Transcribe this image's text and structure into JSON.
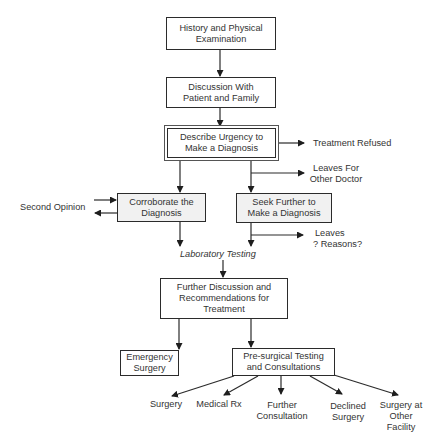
{
  "diagram": {
    "type": "flowchart",
    "nodes": {
      "history": {
        "line1": "History and Physical",
        "line2": "Examination"
      },
      "discussion": {
        "line1": "Discussion With",
        "line2": "Patient and Family"
      },
      "urgency": {
        "line1": "Describe Urgency to",
        "line2": "Make a Diagnosis"
      },
      "corroborate": {
        "line1": "Corroborate the",
        "line2": "Diagnosis"
      },
      "seek": {
        "line1": "Seek Further to",
        "line2": "Make a Diagnosis"
      },
      "further_discussion": {
        "line1": "Further Discussion and",
        "line2": "Recommendations for",
        "line3": "Treatment"
      },
      "emergency": {
        "line1": "Emergency",
        "line2": "Surgery"
      },
      "presurgical": {
        "line1": "Pre-surgical Testing",
        "line2": "and Consultations"
      }
    },
    "side_labels": {
      "treatment_refused": "Treatment Refused",
      "leaves_other_doctor": {
        "line1": "Leaves For",
        "line2": "Other Doctor"
      },
      "second_opinion": "Second Opinion",
      "leaves_reasons": {
        "line1": "Leaves",
        "line2": "? Reasons?"
      },
      "laboratory_testing": "Laboratory Testing"
    },
    "outcomes": {
      "surgery": {
        "line1": "Surgery"
      },
      "medical_rx": {
        "line1": "Medical Rx"
      },
      "further_consultation": {
        "line1": "Further",
        "line2": "Consultation"
      },
      "declined_surgery": {
        "line1": "Declined",
        "line2": "Surgery"
      },
      "surgery_other_facility": {
        "line1": "Surgery at",
        "line2": "Other",
        "line3": "Facility"
      }
    },
    "edges": [
      [
        "History and Physical Examination",
        "Discussion With Patient and Family"
      ],
      [
        "Discussion With Patient and Family",
        "Describe Urgency to Make a Diagnosis"
      ],
      [
        "Describe Urgency to Make a Diagnosis",
        "Treatment Refused"
      ],
      [
        "Describe Urgency to Make a Diagnosis",
        "Corroborate the Diagnosis"
      ],
      [
        "Describe Urgency to Make a Diagnosis",
        "Seek Further to Make a Diagnosis"
      ],
      [
        "Describe Urgency to Make a Diagnosis",
        "Leaves For Other Doctor"
      ],
      [
        "Second Opinion",
        "Corroborate the Diagnosis"
      ],
      [
        "Corroborate the Diagnosis",
        "Second Opinion"
      ],
      [
        "Corroborate the Diagnosis",
        "Laboratory Testing"
      ],
      [
        "Seek Further to Make a Diagnosis",
        "Laboratory Testing"
      ],
      [
        "Seek Further to Make a Diagnosis",
        "Leaves ? Reasons?"
      ],
      [
        "Laboratory Testing",
        "Further Discussion and Recommendations for Treatment"
      ],
      [
        "Further Discussion and Recommendations for Treatment",
        "Emergency Surgery"
      ],
      [
        "Further Discussion and Recommendations for Treatment",
        "Pre-surgical Testing and Consultations"
      ],
      [
        "Pre-surgical Testing and Consultations",
        "Surgery"
      ],
      [
        "Pre-surgical Testing and Consultations",
        "Medical Rx"
      ],
      [
        "Pre-surgical Testing and Consultations",
        "Further Consultation"
      ],
      [
        "Pre-surgical Testing and Consultations",
        "Declined Surgery"
      ],
      [
        "Pre-surgical Testing and Consultations",
        "Surgery at Other Facility"
      ]
    ],
    "colors": {
      "line": "#2b2b2b",
      "shaded_fill": "#f1f1f1",
      "text": "#333333"
    }
  }
}
